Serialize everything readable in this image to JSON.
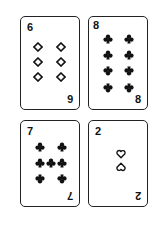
{
  "cards": [
    {
      "rank": "6",
      "suit": "diamonds",
      "suit_style": "outline",
      "bottom_rank_rotated": true
    },
    {
      "rank": "8",
      "suit": "clubs",
      "suit_style": "filled",
      "bottom_rank_rotated": false
    },
    {
      "rank": "7",
      "suit": "clubs",
      "suit_style": "filled",
      "bottom_rank_rotated": true
    },
    {
      "rank": "2",
      "suit": "hearts",
      "suit_style": "outline",
      "bottom_rank_rotated": true
    }
  ],
  "colors": {
    "ink": "#111111",
    "border": "#222222",
    "background": "#ffffff"
  }
}
